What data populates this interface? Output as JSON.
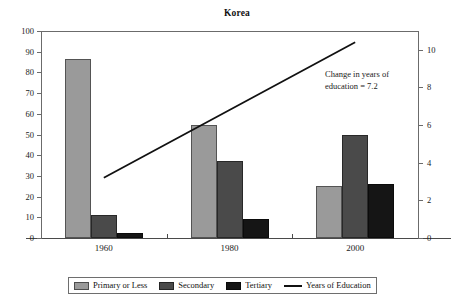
{
  "chart_data": {
    "type": "bar",
    "title": "Korea",
    "xlabel": "",
    "ylabel": "",
    "categories": [
      "1960",
      "1980",
      "2000"
    ],
    "series": [
      {
        "name": "Primary or Less",
        "values": [
          86.5,
          54.5,
          25.0
        ],
        "color": "#9a9a9a",
        "axis": "left"
      },
      {
        "name": "Secondary",
        "values": [
          11.0,
          37.0,
          50.0
        ],
        "color": "#4a4a4a",
        "axis": "left"
      },
      {
        "name": "Tertiary",
        "values": [
          2.5,
          9.0,
          26.0
        ],
        "color": "#151515",
        "axis": "left"
      }
    ],
    "line_series": {
      "name": "Years of Education",
      "values": [
        3.2,
        6.8,
        10.4
      ],
      "color": "#111111",
      "axis": "right"
    },
    "ylim": [
      0,
      100
    ],
    "y2lim": [
      0,
      11
    ],
    "left_ticks": [
      "0",
      "10",
      "20",
      "30",
      "40",
      "50",
      "60",
      "70",
      "80",
      "90",
      "100"
    ],
    "right_ticks": [
      "0",
      "2",
      "4",
      "6",
      "8",
      "10"
    ],
    "grid": false,
    "legend_position": "bottom",
    "annotation": {
      "line1": "Change in years of",
      "line2": "education = 7.2"
    }
  },
  "legend": {
    "items": [
      {
        "label": "Primary or Less",
        "marker": "swatch"
      },
      {
        "label": "Secondary",
        "marker": "swatch"
      },
      {
        "label": "Tertiary",
        "marker": "swatch"
      },
      {
        "label": "Years of Education",
        "marker": "line"
      }
    ]
  }
}
